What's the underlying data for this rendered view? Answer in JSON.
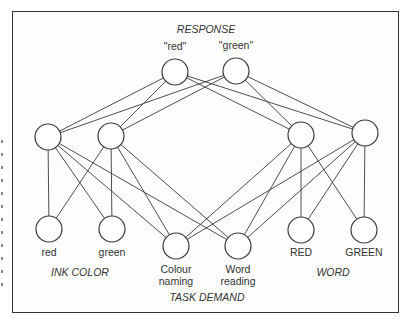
{
  "diagram": {
    "groups": {
      "response": "RESPONSE",
      "ink_color": "INK COLOR",
      "word": "WORD",
      "task_demand": "TASK DEMAND"
    },
    "nodes": {
      "resp_red": {
        "label": "\"red\"",
        "x": 175,
        "y": 72,
        "label_x": 175,
        "label_y": 44
      },
      "resp_green": {
        "label": "\"green\"",
        "x": 236,
        "y": 71,
        "label_x": 236,
        "label_y": 43
      },
      "hid_l1": {
        "label": "",
        "x": 48,
        "y": 137
      },
      "hid_l2": {
        "label": "",
        "x": 111,
        "y": 136
      },
      "hid_r1": {
        "label": "",
        "x": 301,
        "y": 135
      },
      "hid_r2": {
        "label": "",
        "x": 365,
        "y": 133
      },
      "ink_red": {
        "label": "red",
        "x": 49,
        "y": 229,
        "label_x": 49,
        "label_y": 248
      },
      "ink_green": {
        "label": "green",
        "x": 112,
        "y": 229,
        "label_x": 112,
        "label_y": 248
      },
      "task_colour": {
        "label": "Colour",
        "label2": "naming",
        "x": 176,
        "y": 246,
        "label_x": 176,
        "label_y": 265
      },
      "task_word": {
        "label": "Word",
        "label2": "reading",
        "x": 238,
        "y": 246,
        "label_x": 238,
        "label_y": 265
      },
      "word_red": {
        "label": "RED",
        "x": 301,
        "y": 230,
        "label_x": 301,
        "label_y": 248
      },
      "word_green": {
        "label": "GREEN",
        "x": 364,
        "y": 230,
        "label_x": 364,
        "label_y": 248
      }
    },
    "node_radius": 13,
    "edges": [
      [
        "resp_red",
        "hid_l1"
      ],
      [
        "resp_red",
        "hid_l2"
      ],
      [
        "resp_red",
        "hid_r1"
      ],
      [
        "resp_red",
        "hid_r2"
      ],
      [
        "resp_green",
        "hid_l1"
      ],
      [
        "resp_green",
        "hid_l2"
      ],
      [
        "resp_green",
        "hid_r1"
      ],
      [
        "resp_green",
        "hid_r2"
      ],
      [
        "hid_l1",
        "ink_red"
      ],
      [
        "hid_l1",
        "ink_green"
      ],
      [
        "hid_l1",
        "task_colour"
      ],
      [
        "hid_l1",
        "task_word"
      ],
      [
        "hid_l2",
        "ink_red"
      ],
      [
        "hid_l2",
        "ink_green"
      ],
      [
        "hid_l2",
        "task_colour"
      ],
      [
        "hid_l2",
        "task_word"
      ],
      [
        "hid_r1",
        "word_red"
      ],
      [
        "hid_r1",
        "word_green"
      ],
      [
        "hid_r1",
        "task_colour"
      ],
      [
        "hid_r1",
        "task_word"
      ],
      [
        "hid_r2",
        "word_red"
      ],
      [
        "hid_r2",
        "word_green"
      ],
      [
        "hid_r2",
        "task_colour"
      ],
      [
        "hid_r2",
        "task_word"
      ]
    ],
    "colors": {
      "stroke": "#3a3a3a",
      "text": "#333333",
      "frame": "#333333"
    }
  }
}
